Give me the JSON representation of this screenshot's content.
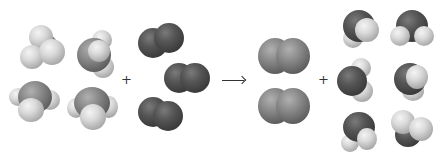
{
  "diagram": {
    "title": "",
    "reaction": "4 NH3 + 3 O2 -> 2 N2 + 6 H2O",
    "colors": {
      "hydrogen": "#d9d9d9",
      "nitrogen": "#8a8a8a",
      "oxygen": "#555555",
      "symbol": "#333333"
    },
    "symbols": {
      "plus1": "+",
      "plus2": "+",
      "arrow": "⟶"
    },
    "reactants": [
      {
        "formula": "NH3",
        "count": 4
      },
      {
        "formula": "O2",
        "count": 3
      }
    ],
    "products": [
      {
        "formula": "N2",
        "count": 2
      },
      {
        "formula": "H2O",
        "count": 6
      }
    ]
  }
}
